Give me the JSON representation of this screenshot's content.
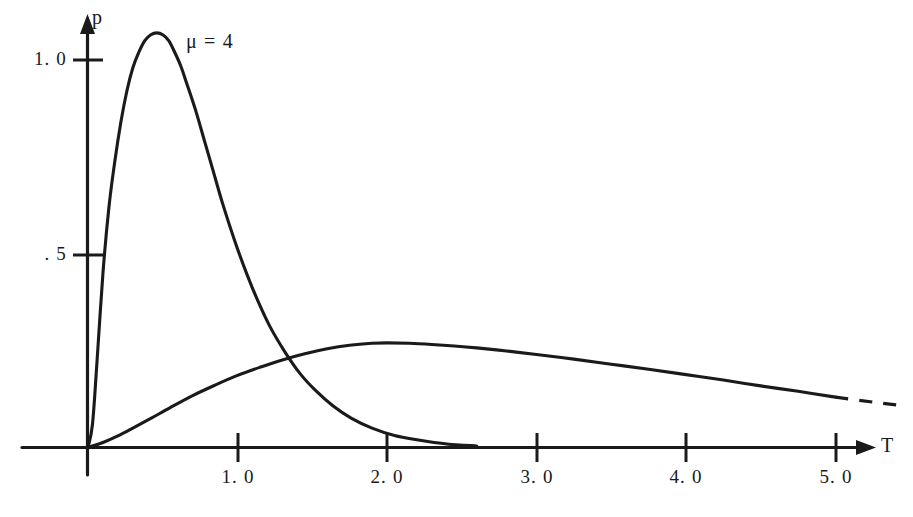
{
  "chart_data": {
    "type": "line",
    "title": "",
    "xlabel": "T",
    "ylabel": "p",
    "xlim": [
      -0.44,
      5.5
    ],
    "ylim": [
      0,
      1.18
    ],
    "grid": false,
    "legend_position": "inline-annotation",
    "x_ticks": [
      "1.0",
      "2.0",
      "3.0",
      "4.0",
      "5.0"
    ],
    "x_tick_values": [
      1.0,
      2.0,
      3.0,
      4.0,
      5.0
    ],
    "y_ticks": [
      "1.0",
      ".5"
    ],
    "y_tick_values": [
      1.0,
      0.5
    ],
    "annotations": [
      {
        "text": "μ = 4",
        "x": 0.67,
        "y": 1.04
      }
    ],
    "series": [
      {
        "name": "μ = 4",
        "style": "solid",
        "peak_x": 0.48,
        "peak_y": 1.07,
        "x": [
          0.0,
          0.03,
          0.06,
          0.1,
          0.14,
          0.18,
          0.22,
          0.26,
          0.3,
          0.34,
          0.38,
          0.42,
          0.46,
          0.5,
          0.54,
          0.58,
          0.62,
          0.66,
          0.72,
          0.78,
          0.84,
          0.9,
          0.98,
          1.06,
          1.14,
          1.22,
          1.32,
          1.42,
          1.52,
          1.64,
          1.76,
          1.9,
          2.05,
          2.2,
          2.4,
          2.6
        ],
        "y": [
          0.0,
          0.06,
          0.22,
          0.45,
          0.62,
          0.74,
          0.84,
          0.92,
          0.98,
          1.02,
          1.05,
          1.065,
          1.07,
          1.065,
          1.05,
          1.02,
          0.985,
          0.94,
          0.87,
          0.79,
          0.71,
          0.63,
          0.535,
          0.45,
          0.375,
          0.31,
          0.245,
          0.19,
          0.148,
          0.107,
          0.076,
          0.05,
          0.031,
          0.02,
          0.009,
          0.004
        ]
      },
      {
        "name": "broad-curve",
        "style": "solid-with-dashed-tail",
        "peak_x": 2.0,
        "peak_y": 0.27,
        "dash_starts_at_x": 5.0,
        "x": [
          0.0,
          0.1,
          0.2,
          0.3,
          0.42,
          0.55,
          0.7,
          0.85,
          1.0,
          1.15,
          1.3,
          1.45,
          1.6,
          1.75,
          1.9,
          2.0,
          2.15,
          2.3,
          2.45,
          2.6,
          2.8,
          3.0,
          3.25,
          3.5,
          3.75,
          4.0,
          4.25,
          4.5,
          4.75,
          5.0,
          5.25,
          5.45
        ],
        "y": [
          0.0,
          0.013,
          0.03,
          0.05,
          0.075,
          0.103,
          0.134,
          0.161,
          0.186,
          0.207,
          0.226,
          0.242,
          0.255,
          0.264,
          0.269,
          0.27,
          0.269,
          0.266,
          0.262,
          0.257,
          0.249,
          0.24,
          0.228,
          0.215,
          0.202,
          0.188,
          0.174,
          0.159,
          0.145,
          0.13,
          0.117,
          0.108
        ]
      }
    ]
  },
  "axes": {
    "y_axis_label": "p",
    "x_axis_label": "T",
    "y_tick_labels": [
      {
        "text": "1. 0",
        "value": 1.0
      },
      {
        "text": ". 5",
        "value": 0.5
      }
    ],
    "x_tick_labels": [
      {
        "text": "1. 0",
        "value": 1.0
      },
      {
        "text": "2. 0",
        "value": 2.0
      },
      {
        "text": "3. 0",
        "value": 3.0
      },
      {
        "text": "4. 0",
        "value": 4.0
      },
      {
        "text": "5. 0",
        "value": 5.0
      }
    ]
  },
  "annotation": {
    "mu_label": "μ = 4"
  },
  "colors": {
    "ink": "#1a1a1a",
    "background": "#ffffff"
  }
}
